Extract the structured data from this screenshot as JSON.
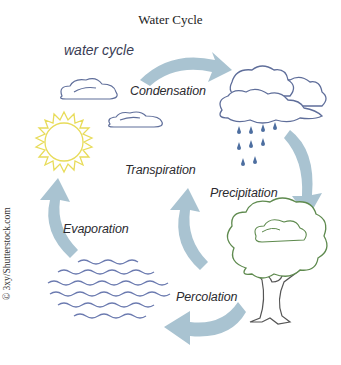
{
  "title": "Water Cycle",
  "subtitle": "water cycle",
  "stages": {
    "condensation": "Condensation",
    "precipitation": "Precipitation",
    "percolation": "Percolation",
    "evaporation": "Evaporation",
    "transpiration": "Transpiration"
  },
  "credit": "© 3xy/Shutterstock.com",
  "colors": {
    "arrow": "#a9c3d1",
    "cloud_outline": "#5f6e9a",
    "sun_outline": "#e8dc5a",
    "tree_outline": "#5e8a4e",
    "trunk_outline": "#555555",
    "water_wave": "#6c7bb0",
    "rain_drop": "#4d6ea0"
  },
  "icons": [
    "sun-icon",
    "cloud-icon",
    "rain-cloud-icon",
    "tree-icon",
    "water-waves-icon",
    "cycle-arrow-icon"
  ]
}
